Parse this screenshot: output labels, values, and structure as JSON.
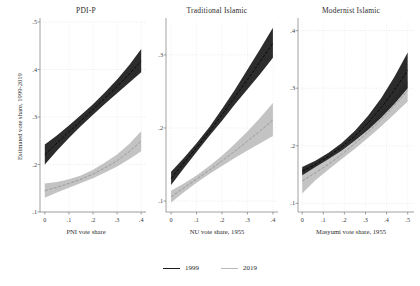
{
  "figure": {
    "ylabel": "Estimated vote share, 1999-2019",
    "legend": {
      "position": "bottom-center",
      "items": [
        {
          "label": "1999",
          "color": "#1c1c1c"
        },
        {
          "label": "2019",
          "color": "#b8b8b8"
        }
      ]
    }
  },
  "chart_data": [
    {
      "type": "line",
      "title": "PDI-P",
      "xlabel": "PNI vote share",
      "ylabel": "Estimated vote share, 1999-2019",
      "xlim": [
        -0.02,
        0.42
      ],
      "ylim": [
        0.1,
        0.5
      ],
      "xticks": [
        0,
        0.1,
        0.2,
        0.3,
        0.4
      ],
      "xticklabels": [
        "0",
        ".1",
        ".2",
        ".3",
        ".4"
      ],
      "yticks": [
        0.1,
        0.2,
        0.3,
        0.4,
        0.5
      ],
      "yticklabels": [
        ".1",
        ".2",
        ".3",
        ".4",
        ".5"
      ],
      "grid": true,
      "series": [
        {
          "name": "1999",
          "color": "#1c1c1c",
          "x": [
            0,
            0.05,
            0.1,
            0.15,
            0.2,
            0.25,
            0.3,
            0.35,
            0.4
          ],
          "fit": [
            0.221,
            0.245,
            0.269,
            0.292,
            0.316,
            0.34,
            0.364,
            0.39,
            0.418
          ],
          "ci_low": [
            0.2,
            0.229,
            0.256,
            0.281,
            0.305,
            0.328,
            0.35,
            0.372,
            0.394
          ],
          "ci_high": [
            0.242,
            0.261,
            0.282,
            0.304,
            0.327,
            0.352,
            0.379,
            0.409,
            0.443
          ]
        },
        {
          "name": "2019",
          "color": "#b8b8b8",
          "x": [
            0,
            0.05,
            0.1,
            0.15,
            0.2,
            0.25,
            0.3,
            0.35,
            0.4
          ],
          "fit": [
            0.145,
            0.152,
            0.16,
            0.169,
            0.18,
            0.193,
            0.208,
            0.227,
            0.249
          ],
          "ci_low": [
            0.13,
            0.141,
            0.151,
            0.161,
            0.171,
            0.183,
            0.196,
            0.211,
            0.228
          ],
          "ci_high": [
            0.16,
            0.163,
            0.169,
            0.177,
            0.189,
            0.204,
            0.221,
            0.243,
            0.27
          ]
        }
      ]
    },
    {
      "type": "line",
      "title": "Traditional Islamic",
      "xlabel": "NU vote share, 1955",
      "ylabel": "",
      "xlim": [
        -0.02,
        0.42
      ],
      "ylim": [
        0.085,
        0.345
      ],
      "xticks": [
        0,
        0.1,
        0.2,
        0.3,
        0.4
      ],
      "xticklabels": [
        "0",
        ".1",
        ".2",
        ".3",
        ".4"
      ],
      "yticks": [
        0.1,
        0.2,
        0.3
      ],
      "yticklabels": [
        ".1",
        ".2",
        ".3"
      ],
      "grid": true,
      "series": [
        {
          "name": "1999",
          "color": "#1c1c1c",
          "x": [
            0,
            0.05,
            0.1,
            0.15,
            0.2,
            0.25,
            0.3,
            0.35,
            0.4
          ],
          "fit": [
            0.131,
            0.152,
            0.173,
            0.195,
            0.218,
            0.242,
            0.266,
            0.291,
            0.316
          ],
          "ci_low": [
            0.122,
            0.145,
            0.167,
            0.189,
            0.21,
            0.232,
            0.253,
            0.274,
            0.296
          ],
          "ci_high": [
            0.14,
            0.159,
            0.179,
            0.201,
            0.226,
            0.252,
            0.28,
            0.308,
            0.337
          ]
        },
        {
          "name": "2019",
          "color": "#b8b8b8",
          "x": [
            0,
            0.05,
            0.1,
            0.15,
            0.2,
            0.25,
            0.3,
            0.35,
            0.4
          ],
          "fit": [
            0.106,
            0.118,
            0.13,
            0.142,
            0.155,
            0.168,
            0.182,
            0.196,
            0.211
          ],
          "ci_low": [
            0.098,
            0.112,
            0.125,
            0.137,
            0.148,
            0.159,
            0.169,
            0.179,
            0.189
          ],
          "ci_high": [
            0.114,
            0.124,
            0.135,
            0.148,
            0.162,
            0.178,
            0.195,
            0.214,
            0.234
          ]
        }
      ]
    },
    {
      "type": "line",
      "title": "Modernist Islamic",
      "xlabel": "Masyumi vote share, 1955",
      "ylabel": "",
      "xlim": [
        -0.02,
        0.53
      ],
      "ylim": [
        0.085,
        0.415
      ],
      "xticks": [
        0,
        0.1,
        0.2,
        0.3,
        0.4,
        0.5
      ],
      "xticklabels": [
        "0",
        ".1",
        ".2",
        ".3",
        ".4",
        ".5"
      ],
      "yticks": [
        0.1,
        0.2,
        0.3,
        0.4
      ],
      "yticklabels": [
        ".1",
        ".2",
        ".3",
        ".4"
      ],
      "grid": true,
      "series": [
        {
          "name": "1999",
          "color": "#1c1c1c",
          "x": [
            0,
            0.0625,
            0.125,
            0.1875,
            0.25,
            0.3125,
            0.375,
            0.4375,
            0.5
          ],
          "fit": [
            0.156,
            0.168,
            0.182,
            0.198,
            0.217,
            0.24,
            0.266,
            0.297,
            0.331
          ],
          "ci_low": [
            0.149,
            0.163,
            0.177,
            0.192,
            0.209,
            0.228,
            0.249,
            0.273,
            0.3
          ],
          "ci_high": [
            0.163,
            0.174,
            0.188,
            0.205,
            0.226,
            0.252,
            0.283,
            0.32,
            0.362
          ]
        },
        {
          "name": "2019",
          "color": "#b8b8b8",
          "x": [
            0,
            0.0625,
            0.125,
            0.1875,
            0.25,
            0.3125,
            0.375,
            0.4375,
            0.5
          ],
          "fit": [
            0.139,
            0.153,
            0.168,
            0.185,
            0.204,
            0.224,
            0.246,
            0.27,
            0.296
          ],
          "ci_low": [
            0.117,
            0.14,
            0.159,
            0.177,
            0.195,
            0.214,
            0.234,
            0.255,
            0.277
          ],
          "ci_high": [
            0.16,
            0.167,
            0.177,
            0.193,
            0.212,
            0.234,
            0.258,
            0.285,
            0.314
          ]
        }
      ]
    }
  ]
}
